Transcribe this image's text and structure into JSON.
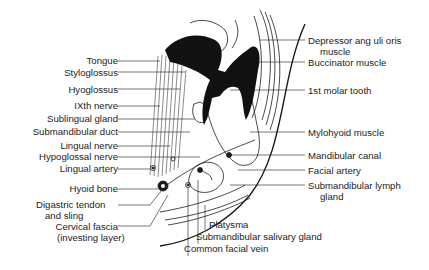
{
  "figure": {
    "labels_left": [
      {
        "id": "tongue",
        "text": "Tongue"
      },
      {
        "id": "styloglossus",
        "text": "Styloglossus"
      },
      {
        "id": "hyoglossus",
        "text": "Hyoglossus"
      },
      {
        "id": "ixth-nerve",
        "text": "IXth nerve"
      },
      {
        "id": "sublingual-gland",
        "text": "Sublingual gland"
      },
      {
        "id": "submandibular-duct",
        "text": "Submandibular duct"
      },
      {
        "id": "lingual-nerve",
        "text": "Lingual nerve"
      },
      {
        "id": "hypoglossal-nerve",
        "text": "Hypoglossal nerve"
      },
      {
        "id": "lingual-artery",
        "text": "Lingual artery"
      },
      {
        "id": "hyoid-bone",
        "text": "Hyoid bone"
      },
      {
        "id": "digastric-tendon",
        "text": "Digastric tendon"
      },
      {
        "id": "digastric-tendon-2",
        "text": "and sling"
      },
      {
        "id": "cervical-fascia",
        "text": "Cervical fascia"
      },
      {
        "id": "cervical-fascia-2",
        "text": "(investing layer)"
      }
    ],
    "labels_right": [
      {
        "id": "depressor",
        "text": "Depressor ang uli oris"
      },
      {
        "id": "depressor-2",
        "text": "muscle"
      },
      {
        "id": "buccinator",
        "text": "Buccinator muscle"
      },
      {
        "id": "molar",
        "text": "1st molar tooth"
      },
      {
        "id": "mylohyoid",
        "text": "Mylohyoid muscle"
      },
      {
        "id": "mandibular-canal",
        "text": "Mandibular canal"
      },
      {
        "id": "facial-artery",
        "text": "Facial artery"
      },
      {
        "id": "lymph-gland",
        "text": "Submandibular lymph"
      },
      {
        "id": "lymph-gland-2",
        "text": "gland"
      }
    ],
    "labels_bottom": [
      {
        "id": "platysma",
        "text": "Platysma"
      },
      {
        "id": "salivary-gland",
        "text": "Submandibular salivary gland"
      },
      {
        "id": "facial-vein",
        "text": "Common facial vein"
      }
    ],
    "colors": {
      "ink": "#1a1a1a",
      "background": "#ffffff"
    }
  }
}
